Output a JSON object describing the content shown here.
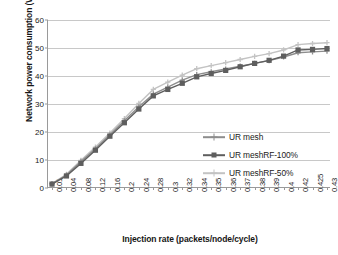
{
  "chart_data": {
    "type": "line",
    "title": "",
    "xlabel": "Injection rate (packets/node/cycle)",
    "ylabel": "Network power consumption (W)",
    "categories": [
      "0.01",
      "0.04",
      "0.08",
      "0.12",
      "0.16",
      "0.2",
      "0.24",
      "0.28",
      "0.3",
      "0.32",
      "0.34",
      "0.35",
      "0.36",
      "0.37",
      "0.38",
      "0.39",
      "0.4",
      "0.42",
      "0.425",
      "0.43"
    ],
    "ylim": [
      0,
      60
    ],
    "yticks": [
      0,
      10,
      20,
      30,
      40,
      50,
      60
    ],
    "grid": "horizontal",
    "legend_position": "inside-right",
    "series": [
      {
        "name": "UR mesh",
        "color": "#8d8d8d",
        "marker": "cross",
        "values": [
          1.5,
          4.6,
          9.5,
          14.0,
          19.0,
          24.0,
          29.0,
          33.5,
          36.0,
          38.5,
          40.5,
          41.5,
          42.5,
          43.5,
          44.5,
          45.5,
          46.8,
          48.3,
          48.6,
          48.9
        ]
      },
      {
        "name": "UR meshRF-100%",
        "color": "#5e5e5e",
        "marker": "square",
        "values": [
          1.4,
          4.3,
          8.8,
          13.5,
          18.5,
          23.3,
          28.2,
          32.9,
          35.2,
          37.4,
          39.7,
          40.9,
          42.0,
          43.3,
          44.5,
          45.6,
          47.1,
          49.3,
          49.5,
          49.8
        ]
      },
      {
        "name": "UR meshRF-50%",
        "color": "#c3c3c3",
        "marker": "cross",
        "values": [
          1.6,
          4.9,
          9.9,
          14.6,
          19.6,
          24.8,
          30.2,
          35.2,
          37.8,
          40.3,
          42.6,
          43.7,
          44.8,
          45.9,
          47.0,
          48.0,
          49.3,
          51.2,
          51.6,
          51.9
        ]
      }
    ]
  },
  "legend": {
    "items": [
      {
        "label": "UR mesh"
      },
      {
        "label": "UR meshRF-100%"
      },
      {
        "label": "UR meshRF-50%"
      }
    ]
  }
}
